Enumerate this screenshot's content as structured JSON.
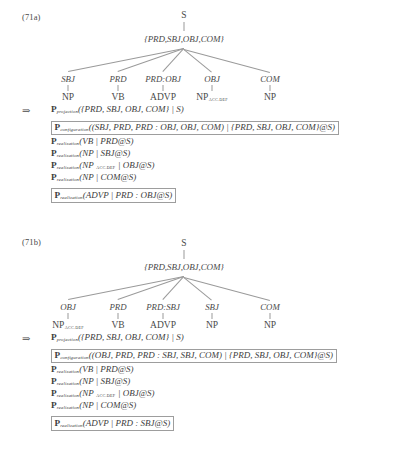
{
  "page": {
    "arrow_marker": "⇒",
    "accent_box_color": "#9d9d9d",
    "text_color": "#404040",
    "line_color": "#9a9a9a"
  },
  "examples": [
    {
      "number": "(71a)",
      "tree": {
        "root": "S",
        "set_node": "{PRD,SBJ,OBJ,COM}",
        "functions": [
          "SBJ",
          "PRD",
          "PRD:OBJ",
          "OBJ",
          "COM"
        ],
        "leaves": [
          {
            "label": "NP",
            "subscript": ""
          },
          {
            "label": "VB",
            "subscript": ""
          },
          {
            "label": "ADVP",
            "subscript": ""
          },
          {
            "label": "NP",
            "subscript": "ACC.DEF"
          },
          {
            "label": "NP",
            "subscript": ""
          }
        ]
      },
      "rules": [
        {
          "name": "P",
          "subscript": "projection",
          "args": "({PRD, SBJ, OBJ, COM} | S)",
          "boxed": false
        },
        {
          "name": "P",
          "subscript": "configuration",
          "args": "((SBJ, PRD, PRD : OBJ, OBJ, COM) | {PRD, SBJ, OBJ, COM}@S)",
          "boxed": true
        },
        {
          "name": "P",
          "subscript": "realization",
          "args": "(VB | PRD@S)",
          "boxed": false
        },
        {
          "name": "P",
          "subscript": "realization",
          "args": "(NP | SBJ@S)",
          "boxed": false
        },
        {
          "name": "P",
          "subscript": "realization",
          "args": "(NP ACC.DEF | OBJ@S)",
          "boxed": false
        },
        {
          "name": "P",
          "subscript": "realization",
          "args": "(NP | COM@S)",
          "boxed": false
        },
        {
          "name": "P",
          "subscript": "realization",
          "args": "(ADVP | PRD : OBJ@S)",
          "boxed": true
        }
      ]
    },
    {
      "number": "(71b)",
      "tree": {
        "root": "S",
        "set_node": "{PRD,SBJ,OBJ,COM}",
        "functions": [
          "OBJ",
          "PRD",
          "PRD:SBJ",
          "SBJ",
          "COM"
        ],
        "leaves": [
          {
            "label": "NP",
            "subscript": "ACC.DEF"
          },
          {
            "label": "VB",
            "subscript": ""
          },
          {
            "label": "ADVP",
            "subscript": ""
          },
          {
            "label": "NP",
            "subscript": ""
          },
          {
            "label": "NP",
            "subscript": ""
          }
        ]
      },
      "rules": [
        {
          "name": "P",
          "subscript": "projection",
          "args": "({PRD, SBJ, OBJ, COM} | S)",
          "boxed": false
        },
        {
          "name": "P",
          "subscript": "configuration",
          "args": "((OBJ, PRD, PRD : SBJ, SBJ, COM) | {PRD, SBJ, OBJ, COM}@S)",
          "boxed": true
        },
        {
          "name": "P",
          "subscript": "realization",
          "args": "(VB | PRD@S)",
          "boxed": false
        },
        {
          "name": "P",
          "subscript": "realization",
          "args": "(NP | SBJ@S)",
          "boxed": false
        },
        {
          "name": "P",
          "subscript": "realization",
          "args": "(NP ACC.DEF | OBJ@S)",
          "boxed": false
        },
        {
          "name": "P",
          "subscript": "realization",
          "args": "(NP | COM@S)",
          "boxed": false
        },
        {
          "name": "P",
          "subscript": "realization",
          "args": "(ADVP | PRD : SBJ@S)",
          "boxed": true
        }
      ]
    }
  ]
}
